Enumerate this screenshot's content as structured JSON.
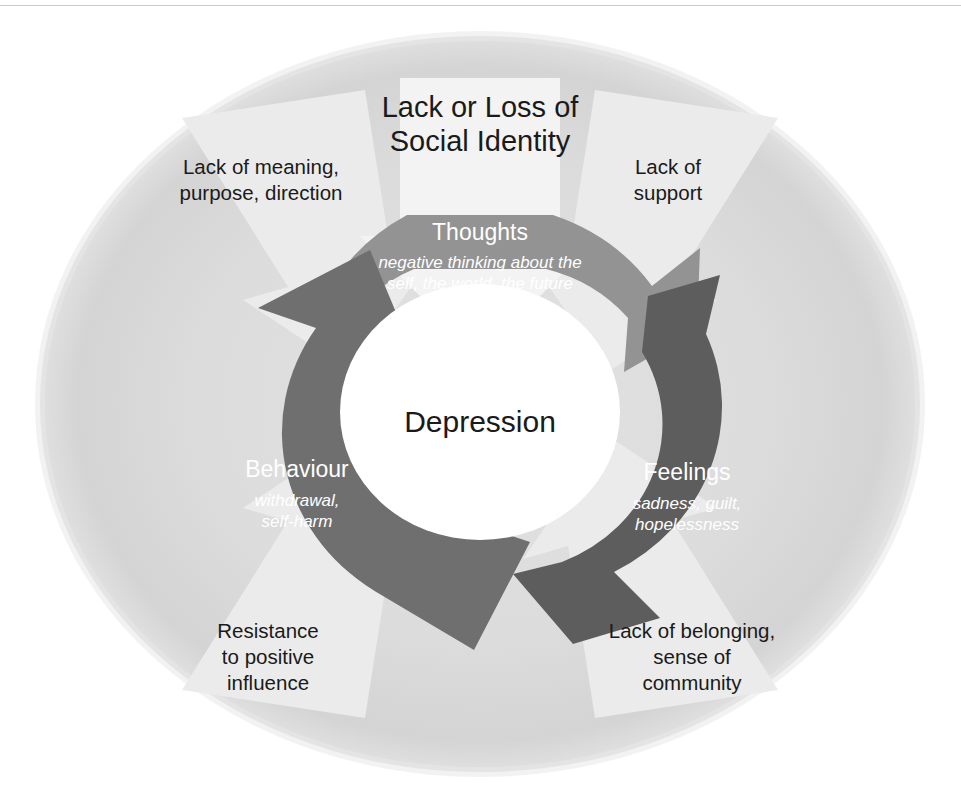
{
  "diagram": {
    "title": {
      "line1": "Lack or Loss of",
      "line2": "Social Identity"
    },
    "center": {
      "label": "Depression"
    },
    "cycle_nodes": [
      {
        "id": "thoughts",
        "title": "Thoughts",
        "sub_line1": "negative thinking about the",
        "sub_line2": "self, the world, the future",
        "color": "#939393",
        "position": "top"
      },
      {
        "id": "feelings",
        "title": "Feelings",
        "sub_line1": "sadness, guilt,",
        "sub_line2": "hopelessness",
        "color": "#5d5d5d",
        "position": "right"
      },
      {
        "id": "behaviour",
        "title": "Behaviour",
        "sub_line1": "withdrawal,",
        "sub_line2": "self-harm",
        "color": "#6f6f6f",
        "position": "left"
      }
    ],
    "outer_factors": [
      {
        "id": "lack-of-meaning",
        "line1": "Lack of meaning,",
        "line2": "purpose, direction",
        "line3": "",
        "position": "top-left"
      },
      {
        "id": "lack-of-support",
        "line1": "Lack of",
        "line2": "support",
        "line3": "",
        "position": "top-right"
      },
      {
        "id": "lack-of-belonging",
        "line1": "Lack of belonging,",
        "line2": "sense of",
        "line3": "community",
        "position": "bottom-right"
      },
      {
        "id": "resistance-to-positive-influence",
        "line1": "Resistance",
        "line2": "to positive",
        "line3": "influence",
        "position": "bottom-left"
      }
    ],
    "colors": {
      "background": "#ffffff",
      "outer_ellipse": "#d7d7d7",
      "outer_arrow": "#e9e9e9",
      "thoughts_arrow": "#939393",
      "feelings_arrow": "#5d5d5d",
      "behaviour_arrow": "#6f6f6f",
      "center_disc": "#ffffff",
      "text_dark": "#1a1a1a",
      "text_light": "#ffffff",
      "rule": "#c9c9cf"
    }
  }
}
